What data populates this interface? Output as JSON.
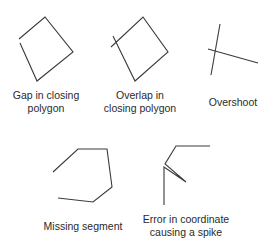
{
  "diagram": {
    "panels": [
      {
        "id": "gap",
        "label_lines": [
          "Gap in closing",
          "polygon"
        ]
      },
      {
        "id": "overlap",
        "label_lines": [
          "Overlap in",
          "closing polygon"
        ]
      },
      {
        "id": "overshoot",
        "label_lines": [
          "Overshoot"
        ]
      },
      {
        "id": "missing-segment",
        "label_lines": [
          "Missing segment"
        ]
      },
      {
        "id": "spike",
        "label_lines": [
          "Error in coordinate",
          "causing a spike"
        ]
      }
    ],
    "colors": {
      "stroke": "#3a3a3a",
      "text": "#2a2a2a",
      "background": "#ffffff"
    }
  }
}
